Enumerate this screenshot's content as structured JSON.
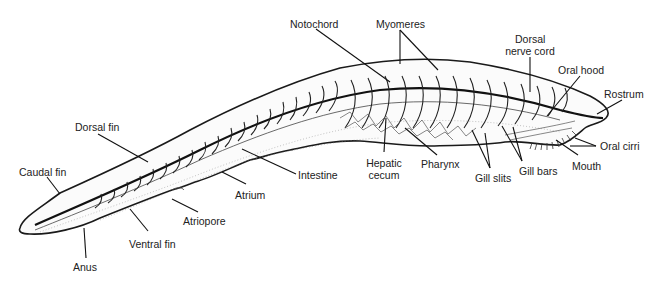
{
  "figure": {
    "labels": {
      "notochord": "Notochord",
      "myomeres": "Myomeres",
      "dorsal_nerve_cord_line1": "Dorsal",
      "dorsal_nerve_cord_line2": "nerve cord",
      "oral_hood": "Oral hood",
      "rostrum": "Rostrum",
      "oral_cirri": "Oral cirri",
      "mouth": "Mouth",
      "gill_bars": "Gill bars",
      "gill_slits": "Gill slits",
      "pharynx": "Pharynx",
      "hepatic_cecum_line1": "Hepatic",
      "hepatic_cecum_line2": "cecum",
      "intestine": "Intestine",
      "atrium": "Atrium",
      "atriopore": "Atriopore",
      "dorsal_fin": "Dorsal fin",
      "caudal_fin": "Caudal fin",
      "ventral_fin": "Ventral fin",
      "anus": "Anus"
    }
  }
}
